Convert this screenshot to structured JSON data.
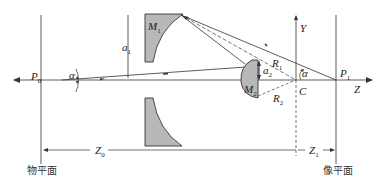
{
  "diagram": {
    "type": "optical-schematic",
    "labels": {
      "P0": "P",
      "P0_sub": "0",
      "P1": "P",
      "P1_sub": "1",
      "M1": "M",
      "M1_sub": "1",
      "M2": "M",
      "M2_sub": "2",
      "a1": "a",
      "a1_sub": "1",
      "a2": "a",
      "a2_sub": "2",
      "R1": "R",
      "R1_sub": "1",
      "R2": "R",
      "R2_sub": "2",
      "alpha_left": "α",
      "alpha_right": "α",
      "C": "C",
      "Y": "Y",
      "Z": "Z",
      "Z0": "Z",
      "Z0_sub": "0",
      "Z1": "Z",
      "Z1_sub": "1",
      "object_plane": "物平面",
      "image_plane": "像平面"
    },
    "colors": {
      "line": "#333333",
      "mirror_fill": "#b8b8b8",
      "background": "#ffffff"
    }
  }
}
